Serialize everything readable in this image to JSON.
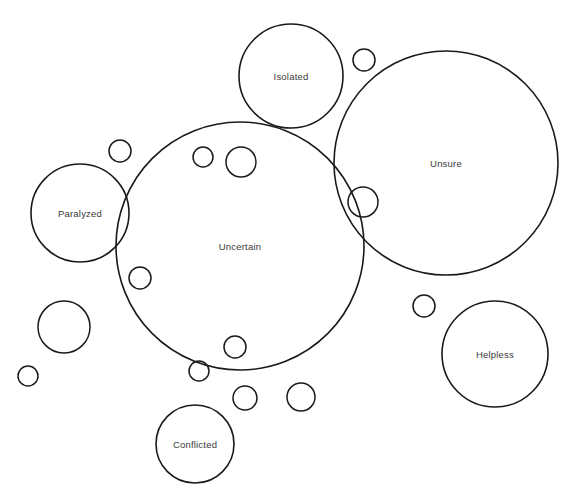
{
  "diagram": {
    "type": "circle-packing",
    "canvas": {
      "width": 577,
      "height": 504,
      "background": "#ffffff"
    },
    "style": {
      "stroke_color": "#1a1a1a",
      "fill_color": "#ffffff",
      "label_color": "#3a3a3a",
      "stroke_width_large": 1.6,
      "stroke_width_small": 1.5
    },
    "labeled_bubbles": [
      {
        "label": "Isolated",
        "cx": 291,
        "cy": 76,
        "r": 52,
        "font_size": 9.5
      },
      {
        "label": "Unsure",
        "cx": 446,
        "cy": 163,
        "r": 112,
        "font_size": 9.5
      },
      {
        "label": "Paralyzed",
        "cx": 80,
        "cy": 213,
        "r": 49,
        "font_size": 9.5
      },
      {
        "label": "Uncertain",
        "cx": 240,
        "cy": 246,
        "r": 124,
        "font_size": 9.5
      },
      {
        "label": "Helpless",
        "cx": 495,
        "cy": 354,
        "r": 53,
        "font_size": 9.5
      },
      {
        "label": "Conflicted",
        "cx": 195,
        "cy": 444,
        "r": 39,
        "font_size": 9.5
      }
    ],
    "unlabeled_bubbles": [
      {
        "cx": 120,
        "cy": 151,
        "r": 11
      },
      {
        "cx": 203,
        "cy": 157,
        "r": 10
      },
      {
        "cx": 241,
        "cy": 162,
        "r": 15
      },
      {
        "cx": 364,
        "cy": 60,
        "r": 11
      },
      {
        "cx": 363,
        "cy": 202,
        "r": 15
      },
      {
        "cx": 140,
        "cy": 278,
        "r": 11
      },
      {
        "cx": 64,
        "cy": 327,
        "r": 26
      },
      {
        "cx": 28,
        "cy": 376,
        "r": 10
      },
      {
        "cx": 235,
        "cy": 347,
        "r": 11
      },
      {
        "cx": 199,
        "cy": 371,
        "r": 10
      },
      {
        "cx": 245,
        "cy": 398,
        "r": 12
      },
      {
        "cx": 301,
        "cy": 397,
        "r": 14
      },
      {
        "cx": 424,
        "cy": 306,
        "r": 11
      }
    ]
  }
}
